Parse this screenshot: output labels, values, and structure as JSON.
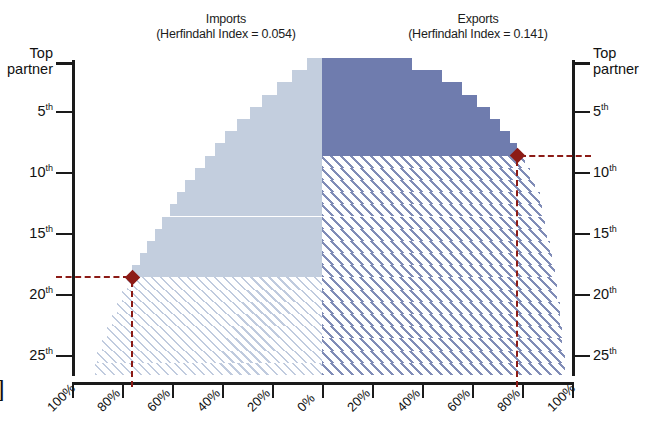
{
  "chart_data": {
    "type": "area",
    "title": "",
    "panels": [
      {
        "name": "imports",
        "title_line1": "Imports",
        "title_line2": "(Herfindahl Index = 0.054)",
        "herfindahl_index": 0.054,
        "side": "left",
        "fill_color": "#c3cede",
        "hatch_color": "#8ca0c3",
        "marker_rank": 18,
        "marker_share_pct": 80,
        "xlabel": "",
        "ylabel": "",
        "xticks": [
          "100%",
          "80%",
          "60%",
          "40%",
          "20%",
          "0%"
        ],
        "xtick_values": [
          100,
          80,
          60,
          40,
          20,
          0
        ],
        "yticks": [
          "Top partner",
          "5th",
          "10th",
          "15th",
          "20th",
          "25th"
        ],
        "ytick_values": [
          1,
          5,
          10,
          15,
          20,
          25
        ],
        "cumulative_share_pct": [
          6,
          12,
          18,
          24,
          29,
          34,
          39,
          43,
          47,
          51,
          55,
          58,
          61,
          64,
          67,
          70,
          73,
          76,
          78,
          80,
          82,
          84,
          86,
          88,
          90,
          91,
          92
        ]
      },
      {
        "name": "exports",
        "title_line1": "Exports",
        "title_line2": "(Herfindahl Index = 0.141)",
        "herfindahl_index": 0.141,
        "side": "right",
        "fill_color": "#6f7cae",
        "hatch_color": "#6a78aa",
        "marker_rank": 8,
        "marker_share_pct": 80,
        "xlabel": "",
        "ylabel": "",
        "xticks": [
          "0%",
          "20%",
          "40%",
          "60%",
          "80%",
          "100%"
        ],
        "xtick_values": [
          0,
          20,
          40,
          60,
          80,
          100
        ],
        "yticks": [
          "Top partner",
          "5th",
          "10th",
          "15th",
          "20th",
          "25th"
        ],
        "ytick_values": [
          1,
          5,
          10,
          15,
          20,
          25
        ],
        "cumulative_share_pct": [
          36,
          48,
          56,
          62,
          67,
          71,
          75,
          78,
          81,
          83,
          85,
          87,
          88,
          89,
          90,
          91,
          92,
          93,
          94,
          94,
          95,
          95,
          96,
          96,
          97,
          97,
          97
        ]
      }
    ],
    "axis_left_title_line1": "Top",
    "axis_left_title_line2": "partner",
    "axis_right_title_line1": "Top",
    "axis_right_title_line2": "partner",
    "marker_color": "#8c1b16",
    "grid": false,
    "legend": "none",
    "edge_glyph": "]"
  },
  "axes": {
    "left": {
      "labels": [
        {
          "text": "Top partner",
          "sup": "",
          "two_line": true,
          "line1": "Top",
          "line2": "partner"
        },
        {
          "text": "5",
          "sup": "th",
          "two_line": false
        },
        {
          "text": "10",
          "sup": "th",
          "two_line": false
        },
        {
          "text": "15",
          "sup": "th",
          "two_line": false
        },
        {
          "text": "20",
          "sup": "th",
          "two_line": false
        },
        {
          "text": "25",
          "sup": "th",
          "two_line": false
        }
      ]
    },
    "right": {
      "labels": [
        {
          "text": "Top partner",
          "sup": "",
          "two_line": true,
          "line1": "Top",
          "line2": "partner"
        },
        {
          "text": "5",
          "sup": "th",
          "two_line": false
        },
        {
          "text": "10",
          "sup": "th",
          "two_line": false
        },
        {
          "text": "15",
          "sup": "th",
          "two_line": false
        },
        {
          "text": "20",
          "sup": "th",
          "two_line": false
        },
        {
          "text": "25",
          "sup": "th",
          "two_line": false
        }
      ]
    },
    "bottom": {
      "labels": [
        "100%",
        "80%",
        "60%",
        "40%",
        "20%",
        "0%",
        "20%",
        "40%",
        "60%",
        "80%",
        "100%"
      ]
    }
  }
}
